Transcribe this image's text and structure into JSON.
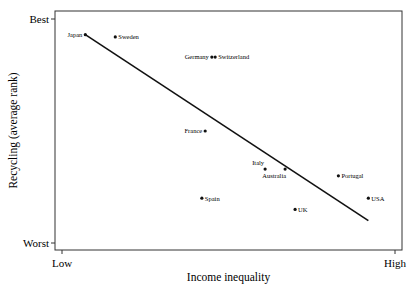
{
  "chart_data": {
    "type": "scatter",
    "title": "",
    "xlabel": "Income inequality",
    "ylabel": "Recycling (average rank)",
    "x_ticks": [
      "Low",
      "High"
    ],
    "y_ticks": [
      "Best",
      "Worst"
    ],
    "xlim": [
      0,
      1
    ],
    "ylim": [
      0,
      1
    ],
    "grid": false,
    "legend": null,
    "points": [
      {
        "label": "Japan",
        "x": 0.07,
        "y": 0.93,
        "label_side": "left"
      },
      {
        "label": "Sweden",
        "x": 0.16,
        "y": 0.92,
        "label_side": "right"
      },
      {
        "label": "Germany",
        "x": 0.45,
        "y": 0.83,
        "label_side": "left"
      },
      {
        "label": "Switzerland",
        "x": 0.46,
        "y": 0.83,
        "label_side": "right"
      },
      {
        "label": "France",
        "x": 0.43,
        "y": 0.5,
        "label_side": "left"
      },
      {
        "label": "Italy",
        "x": 0.61,
        "y": 0.33,
        "label_side": "above-left"
      },
      {
        "label": "Australia",
        "x": 0.67,
        "y": 0.33,
        "label_side": "below-left"
      },
      {
        "label": "Portugal",
        "x": 0.83,
        "y": 0.3,
        "label_side": "right"
      },
      {
        "label": "USA",
        "x": 0.92,
        "y": 0.2,
        "label_side": "right"
      },
      {
        "label": "Spain",
        "x": 0.42,
        "y": 0.2,
        "label_side": "right"
      },
      {
        "label": "UK",
        "x": 0.7,
        "y": 0.15,
        "label_side": "right"
      }
    ],
    "trend_line": {
      "x0": 0.07,
      "y0": 0.93,
      "x1": 0.92,
      "y1": 0.1
    }
  }
}
